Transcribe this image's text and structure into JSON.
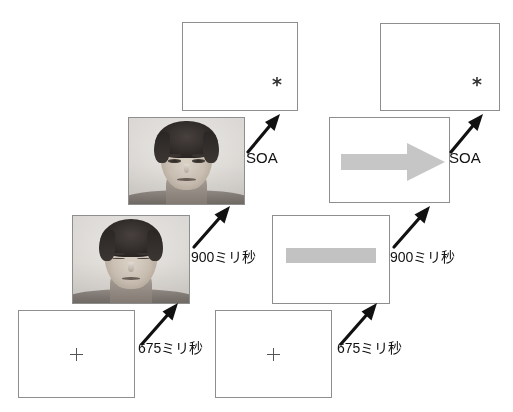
{
  "figure": {
    "background_color": "#ffffff",
    "frame_border_color": "#8e8e8e",
    "cue_grey_color": "#c2c2c2",
    "text_color": "#111111"
  },
  "sequences": [
    {
      "id": "face-cue-sequence",
      "name": "Face cue sequence",
      "steps": [
        {
          "id": "face-fixation",
          "screen_name": "fixation-screen",
          "content_kind": "fixation-cross",
          "content_label": "+"
        },
        {
          "id": "face-neutral-cue",
          "screen_name": "face-cue-screen-eyes-closed",
          "content_kind": "face-photograph",
          "content_label": "face with eyes closed"
        },
        {
          "id": "face-gaze-cue",
          "screen_name": "face-cue-screen-eyes-open",
          "content_kind": "face-photograph",
          "content_label": "face with eyes open"
        },
        {
          "id": "face-target",
          "screen_name": "target-screen",
          "content_kind": "asterisk-target",
          "content_label": "*"
        }
      ],
      "transitions": [
        {
          "id": "face-t1",
          "label": "675ミリ秒",
          "arrow_name": "step-arrow-675ms-left"
        },
        {
          "id": "face-t2",
          "label": "900ミリ秒",
          "arrow_name": "step-arrow-900ms-left"
        },
        {
          "id": "face-t3",
          "label": "SOA",
          "arrow_name": "step-arrow-soa-left"
        }
      ]
    },
    {
      "id": "arrow-cue-sequence",
      "name": "Arrow cue sequence",
      "steps": [
        {
          "id": "arrow-fixation",
          "screen_name": "fixation-screen",
          "content_kind": "fixation-cross",
          "content_label": "+"
        },
        {
          "id": "arrow-neutral-cue",
          "screen_name": "grey-bar-screen",
          "content_kind": "grey-bar",
          "content_label": "grey horizontal bar"
        },
        {
          "id": "arrow-direction-cue",
          "screen_name": "arrow-cue-screen",
          "content_kind": "grey-right-arrow",
          "content_label": "grey rightward arrow"
        },
        {
          "id": "arrow-target",
          "screen_name": "target-screen",
          "content_kind": "asterisk-target",
          "content_label": "*"
        }
      ],
      "transitions": [
        {
          "id": "arrow-t1",
          "label": "675ミリ秒",
          "arrow_name": "step-arrow-675ms-right"
        },
        {
          "id": "arrow-t2",
          "label": "900ミリ秒",
          "arrow_name": "step-arrow-900ms-right"
        },
        {
          "id": "arrow-t3",
          "label": "SOA",
          "arrow_name": "step-arrow-soa-right"
        }
      ]
    }
  ],
  "glyphs": {
    "fixation": "+",
    "asterisk": "*"
  }
}
